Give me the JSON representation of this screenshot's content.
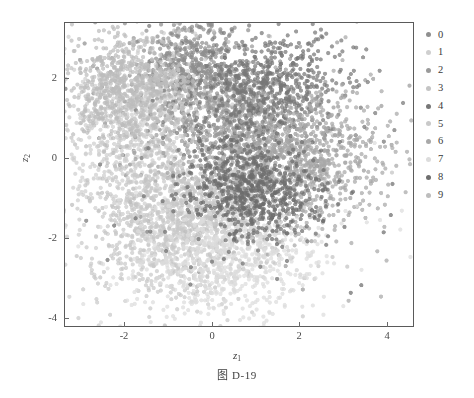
{
  "caption": "图  D-19",
  "axes": {
    "xlabel_main": "z",
    "xlabel_sub": "1",
    "ylabel_main": "z",
    "ylabel_sub": "2",
    "x_ticks": [
      "-2",
      "0",
      "2",
      "4"
    ],
    "y_ticks": [
      "2",
      "0",
      "-2",
      "-4"
    ]
  },
  "legend": {
    "items": [
      {
        "label": "0",
        "color": "#8f8f8f"
      },
      {
        "label": "1",
        "color": "#cfcfcf"
      },
      {
        "label": "2",
        "color": "#9a9a9a"
      },
      {
        "label": "3",
        "color": "#c4c4c4"
      },
      {
        "label": "4",
        "color": "#777777"
      },
      {
        "label": "5",
        "color": "#c9c9c9"
      },
      {
        "label": "6",
        "color": "#a8a8a8"
      },
      {
        "label": "7",
        "color": "#dcdcdc"
      },
      {
        "label": "8",
        "color": "#6e6e6e"
      },
      {
        "label": "9",
        "color": "#bdbdbd"
      }
    ]
  },
  "chart_data": {
    "type": "scatter",
    "title": "",
    "xlabel": "z_1",
    "ylabel": "z_2",
    "xlim": [
      -3.4,
      4.6
    ],
    "ylim": [
      -4.35,
      3.15
    ],
    "grid": false,
    "legend_position": "right-outside",
    "marker_size_px": 4.2,
    "marker_opacity": 0.72,
    "n_classes": 10,
    "total_points": 7000,
    "series": [
      {
        "name": "0",
        "color": "#8f8f8f",
        "n": 700,
        "center": [
          -0.55,
          1.85
        ],
        "spread": [
          0.62,
          0.7
        ],
        "rotation": 15
      },
      {
        "name": "1",
        "color": "#cfcfcf",
        "n": 700,
        "center": [
          -1.75,
          0.55
        ],
        "spread": [
          0.7,
          0.95
        ],
        "rotation": -25
      },
      {
        "name": "2",
        "color": "#9a9a9a",
        "n": 700,
        "center": [
          0.7,
          0.35
        ],
        "spread": [
          0.82,
          0.72
        ],
        "rotation": 10
      },
      {
        "name": "3",
        "color": "#c4c4c4",
        "n": 700,
        "center": [
          -0.25,
          -1.35
        ],
        "spread": [
          0.95,
          0.62
        ],
        "rotation": -8
      },
      {
        "name": "4",
        "color": "#777777",
        "n": 700,
        "center": [
          1.25,
          1.55
        ],
        "spread": [
          0.88,
          0.72
        ],
        "rotation": 22
      },
      {
        "name": "5",
        "color": "#c9c9c9",
        "n": 700,
        "center": [
          -1.1,
          -2.15
        ],
        "spread": [
          0.95,
          0.78
        ],
        "rotation": -15
      },
      {
        "name": "6",
        "color": "#a8a8a8",
        "n": 700,
        "center": [
          2.15,
          -0.35
        ],
        "spread": [
          0.85,
          0.8
        ],
        "rotation": 30
      },
      {
        "name": "7",
        "color": "#dcdcdc",
        "n": 700,
        "center": [
          0.3,
          -2.7
        ],
        "spread": [
          1.05,
          0.72
        ],
        "rotation": 5
      },
      {
        "name": "8",
        "color": "#6e6e6e",
        "n": 700,
        "center": [
          0.95,
          -1.0
        ],
        "spread": [
          0.78,
          0.62
        ],
        "rotation": -18
      },
      {
        "name": "9",
        "color": "#bdbdbd",
        "n": 700,
        "center": [
          -2.05,
          1.55
        ],
        "spread": [
          0.72,
          0.68
        ],
        "rotation": 35
      }
    ]
  }
}
